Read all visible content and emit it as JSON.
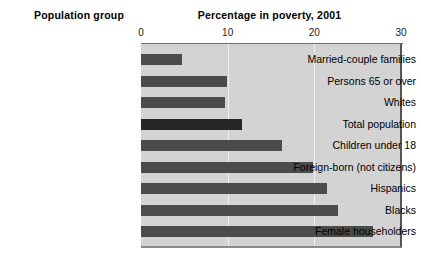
{
  "headers": {
    "group_header": "Population group",
    "chart_title": "Percentage in poverty, 2001"
  },
  "chart_data": {
    "type": "bar",
    "orientation": "horizontal",
    "title": "Percentage in poverty, 2001",
    "xlabel": "Percentage in poverty, 2001",
    "ylabel": "Population group",
    "xlim": [
      0,
      30
    ],
    "xticks": [
      0,
      10,
      20,
      30
    ],
    "xtick_labels": [
      "0",
      "10",
      "20",
      "30"
    ],
    "grid": true,
    "legend": "none",
    "categories": [
      "Married-couple families",
      "Persons 65 or over",
      "Whites",
      "Total population",
      "Children under 18",
      "Foreign-born (not citizens)",
      "Hispanics",
      "Blacks",
      "Female householders"
    ],
    "values": [
      4.7,
      9.9,
      9.7,
      11.7,
      16.3,
      19.9,
      21.5,
      22.7,
      26.8
    ],
    "highlight_index": 3,
    "colors": {
      "bar": "#4b4b4b",
      "bar_highlight": "#262626",
      "plot_background": "#d3d3d3",
      "gridline": "#efefef",
      "text": "#000000"
    }
  }
}
